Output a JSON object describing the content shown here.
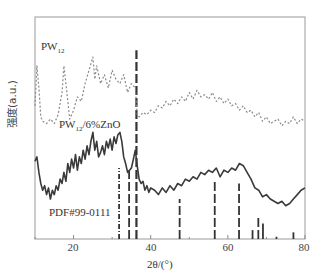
{
  "chart_data": {
    "type": "line",
    "title": "",
    "xlabel": "2θ/(°)",
    "ylabel": "强度(a.u.)",
    "xlim": [
      10,
      80
    ],
    "ylim": [
      0,
      100
    ],
    "xticks": [
      20,
      40,
      60,
      80
    ],
    "grid": false,
    "legend": "inline labels",
    "series": [
      {
        "name": "PW12",
        "label_main": "PW",
        "label_sub": "12",
        "style": "dashed",
        "color": "#8a8a8a",
        "x": [
          10,
          10.5,
          11,
          11.5,
          12,
          13,
          14,
          15,
          16,
          17,
          17.5,
          18,
          18.5,
          19,
          20,
          21,
          22,
          23,
          24,
          25,
          25.5,
          26,
          27,
          28,
          29,
          30,
          31,
          32,
          33,
          34,
          35,
          36,
          36.5,
          37,
          38,
          39,
          40,
          41,
          42,
          43,
          44,
          45,
          46,
          47,
          48,
          49,
          50,
          51,
          52,
          53,
          54,
          55,
          56,
          57,
          58,
          59,
          60,
          61,
          62,
          63,
          64,
          65,
          66,
          67,
          68,
          69,
          70,
          71,
          72,
          73,
          74,
          75,
          76,
          77,
          78,
          79,
          80
        ],
        "y": [
          60,
          78,
          68,
          55,
          53,
          52,
          54,
          52,
          56,
          66,
          78,
          70,
          62,
          54,
          58,
          64,
          62,
          70,
          76,
          82,
          72,
          78,
          70,
          74,
          68,
          76,
          72,
          70,
          74,
          66,
          70,
          68,
          56,
          55,
          57,
          56,
          58,
          57,
          60,
          59,
          62,
          60,
          63,
          61,
          64,
          62,
          66,
          63,
          67,
          64,
          65,
          63,
          66,
          62,
          64,
          61,
          63,
          60,
          61,
          58,
          60,
          57,
          58,
          55,
          57,
          53,
          55,
          52,
          53,
          54,
          51,
          53,
          52,
          55,
          52,
          54,
          53
        ]
      },
      {
        "name": "PW12/6%ZnO",
        "label_main": "PW",
        "label_sub": "12",
        "label_tail": "/6%ZnO",
        "style": "solid",
        "color": "#3a3a3a",
        "x": [
          10,
          10.5,
          11,
          11.5,
          12,
          12.5,
          13,
          13.5,
          14,
          14.5,
          15,
          15.5,
          16,
          16.5,
          17,
          17.5,
          18,
          18.5,
          19,
          19.5,
          20,
          20.5,
          21,
          21.5,
          22,
          22.5,
          23,
          23.5,
          24,
          24.5,
          25,
          25.5,
          26,
          26.5,
          27,
          27.5,
          28,
          28.5,
          29,
          29.5,
          30,
          30.5,
          31,
          31.5,
          32,
          32.5,
          33,
          33.5,
          34,
          34.5,
          35,
          35.5,
          36,
          36.5,
          37,
          37.5,
          38,
          38.5,
          39,
          39.5,
          40,
          41,
          42,
          43,
          44,
          45,
          46,
          47,
          48,
          49,
          50,
          51,
          52,
          53,
          54,
          55,
          56,
          57,
          58,
          59,
          60,
          61,
          62,
          63,
          64,
          65,
          66,
          67,
          68,
          69,
          70,
          71,
          72,
          73,
          74,
          75,
          76,
          77,
          78,
          79,
          80
        ],
        "y": [
          35,
          37,
          30,
          25,
          22,
          24,
          20,
          23,
          18,
          22,
          20,
          24,
          22,
          27,
          25,
          30,
          26,
          34,
          30,
          36,
          32,
          38,
          31,
          37,
          34,
          40,
          36,
          42,
          38,
          44,
          48,
          40,
          44,
          37,
          39,
          42,
          38,
          44,
          41,
          45,
          40,
          46,
          43,
          47,
          48,
          44,
          37,
          34,
          30,
          31,
          32,
          36,
          40,
          33,
          27,
          25,
          26,
          22,
          24,
          21,
          23,
          22,
          20,
          23,
          21,
          24,
          22,
          25,
          24,
          27,
          26,
          28,
          27,
          30,
          29,
          31,
          30,
          32,
          28,
          31,
          30,
          32,
          31,
          34,
          33,
          30,
          27,
          23,
          22,
          19,
          20,
          18,
          17,
          16,
          17,
          15,
          16,
          18,
          20,
          22,
          23
        ]
      }
    ],
    "reference": {
      "name": "PDF#99-0111",
      "positions": [
        31.8,
        34.4,
        36.3,
        47.5,
        56.6,
        62.9,
        66.4,
        67.9,
        69.1,
        72.6,
        77.0
      ],
      "heights": [
        32,
        31,
        85,
        18,
        26,
        25,
        4,
        10,
        7,
        1,
        3
      ],
      "styles": [
        "dashdot",
        "dashed",
        "dashed",
        "dashed",
        "dashed",
        "dashed",
        "dashed",
        "dashed",
        "solid",
        "solid",
        "solid"
      ]
    }
  },
  "labels": {
    "series1_main": "PW",
    "series1_sub": "12",
    "series2_main": "PW",
    "series2_sub": "12",
    "series2_tail": "/6%ZnO",
    "reference": "PDF#99-0111",
    "xlabel": "2θ/(°)",
    "ylabel": "强度(a.u.)",
    "ticks": [
      "20",
      "40",
      "60",
      "80"
    ]
  }
}
